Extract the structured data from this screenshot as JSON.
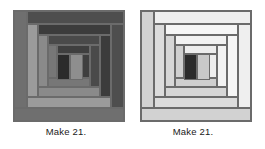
{
  "page": {
    "background": "#ffffff",
    "width": 265,
    "height": 149
  },
  "blocks": [
    {
      "id": "dark-block",
      "name": "Dark log cabin block",
      "caption": "Make 21.",
      "border_color": "#5a5a5a",
      "center": {
        "color": "#2b2b2b",
        "label": "center square"
      },
      "center_partner": {
        "color": "#8e8e8e",
        "label": "light square right of center"
      },
      "logs": [
        {
          "ring": 1,
          "side": "bottom",
          "color": "#777777"
        },
        {
          "ring": 1,
          "side": "left",
          "color": "#777777"
        },
        {
          "ring": 1,
          "side": "top",
          "color": "#3f3f3f"
        },
        {
          "ring": 1,
          "side": "right",
          "color": "#3f3f3f"
        },
        {
          "ring": 2,
          "side": "bottom",
          "color": "#8a8a8a"
        },
        {
          "ring": 2,
          "side": "left",
          "color": "#8a8a8a"
        },
        {
          "ring": 2,
          "side": "top",
          "color": "#4a4a4a"
        },
        {
          "ring": 2,
          "side": "right",
          "color": "#4a4a4a"
        },
        {
          "ring": 3,
          "side": "bottom",
          "color": "#9b9b9b"
        },
        {
          "ring": 3,
          "side": "left",
          "color": "#9b9b9b"
        },
        {
          "ring": 3,
          "side": "top",
          "color": "#3c3c3c"
        },
        {
          "ring": 3,
          "side": "right",
          "color": "#3c3c3c"
        },
        {
          "ring": 4,
          "side": "bottom",
          "color": "#6f6f6f"
        },
        {
          "ring": 4,
          "side": "left",
          "color": "#6f6f6f"
        },
        {
          "ring": 4,
          "side": "top",
          "color": "#4e4e4e"
        },
        {
          "ring": 4,
          "side": "right",
          "color": "#4e4e4e"
        }
      ]
    },
    {
      "id": "light-block",
      "name": "Light log cabin block",
      "caption": "Make 21.",
      "border_color": "#8a8a8a",
      "center": {
        "color": "#2b2b2b",
        "label": "center square"
      },
      "center_partner": {
        "color": "#c9c9c9",
        "label": "light square right of center"
      },
      "logs": [
        {
          "ring": 1,
          "side": "bottom",
          "color": "#cfcfcf"
        },
        {
          "ring": 1,
          "side": "left",
          "color": "#cfcfcf"
        },
        {
          "ring": 1,
          "side": "top",
          "color": "#ededed"
        },
        {
          "ring": 1,
          "side": "right",
          "color": "#ededed"
        },
        {
          "ring": 2,
          "side": "bottom",
          "color": "#d6d6d6"
        },
        {
          "ring": 2,
          "side": "left",
          "color": "#d6d6d6"
        },
        {
          "ring": 2,
          "side": "top",
          "color": "#f2f2f2"
        },
        {
          "ring": 2,
          "side": "right",
          "color": "#f2f2f2"
        },
        {
          "ring": 3,
          "side": "bottom",
          "color": "#dcdcdc"
        },
        {
          "ring": 3,
          "side": "left",
          "color": "#dcdcdc"
        },
        {
          "ring": 3,
          "side": "top",
          "color": "#f6f6f6"
        },
        {
          "ring": 3,
          "side": "right",
          "color": "#f6f6f6"
        },
        {
          "ring": 4,
          "side": "bottom",
          "color": "#d2d2d2"
        },
        {
          "ring": 4,
          "side": "left",
          "color": "#d2d2d2"
        },
        {
          "ring": 4,
          "side": "top",
          "color": "#efefef"
        },
        {
          "ring": 4,
          "side": "right",
          "color": "#efefef"
        }
      ]
    }
  ]
}
